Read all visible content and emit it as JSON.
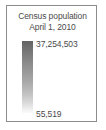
{
  "legend": {
    "title_line1": "Census population",
    "title_line2": "April 1, 2010",
    "max_value": "37,254,503",
    "min_value": "55,519",
    "ramp": {
      "icon": "vertical-gradient-ramp-icon",
      "orientation": "vertical",
      "color_high": "#636363",
      "color_low": "#fafafa"
    },
    "colors": {
      "text": "#4a4a4a",
      "panel_border": "#8c8c8c",
      "panel_background": "#ffffff"
    }
  },
  "chart_data": {
    "type": "heatmap",
    "title": "Census population April 1, 2010",
    "subtitle": "April 1, 2010",
    "legend_kind": "continuous-color-ramp",
    "orientation": "vertical",
    "xlabel": "",
    "ylabel": "",
    "categories": [
      "minimum",
      "maximum"
    ],
    "values": [
      55519,
      37254503
    ],
    "tick_labels": [
      "55,519",
      "37,254,503"
    ],
    "value_range": [
      55519,
      37254503
    ],
    "colormap": {
      "low_color": "#fafafa",
      "high_color": "#636363",
      "stops": [
        {
          "position": 0.0,
          "color": "#fafafa",
          "value": 55519
        },
        {
          "position": 0.5,
          "color": "#a5a5a5"
        },
        {
          "position": 1.0,
          "color": "#636363",
          "value": 37254503
        }
      ]
    },
    "grid": false,
    "legend_position": "standalone"
  }
}
